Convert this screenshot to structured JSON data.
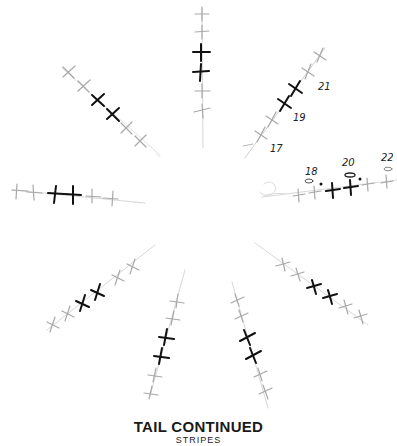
{
  "caption": {
    "title": "TAIL CONTINUED",
    "subtitle": "STRIPES"
  },
  "colors": {
    "light_cross": "#a8a8a8",
    "dark_cross": "#111111",
    "background": "#ffffff"
  },
  "row_labels": {
    "n17": "17",
    "n18": "18",
    "n19": "19",
    "n20": "20",
    "n21": "21",
    "n22": "22"
  },
  "spokes": [
    {
      "name": "top",
      "crosses": [
        "light",
        "light",
        "dark",
        "dark",
        "light",
        "light"
      ]
    },
    {
      "name": "upper-right",
      "crosses": [
        "light",
        "light",
        "dark",
        "dark",
        "light",
        "light"
      ]
    },
    {
      "name": "right",
      "crosses": [
        "light",
        "light",
        "dark",
        "dark",
        "light",
        "light"
      ]
    },
    {
      "name": "lower-right",
      "crosses": [
        "light",
        "light",
        "dark",
        "dark",
        "light",
        "light"
      ]
    },
    {
      "name": "bottom-right",
      "crosses": [
        "light",
        "light",
        "dark",
        "dark",
        "light",
        "light"
      ]
    },
    {
      "name": "bottom-left",
      "crosses": [
        "light",
        "light",
        "dark",
        "dark",
        "light",
        "light"
      ]
    },
    {
      "name": "lower-left",
      "crosses": [
        "light",
        "light",
        "dark",
        "dark",
        "light",
        "light"
      ]
    },
    {
      "name": "left",
      "crosses": [
        "light",
        "light",
        "dark",
        "dark",
        "light",
        "light"
      ]
    },
    {
      "name": "upper-left",
      "crosses": [
        "light",
        "light",
        "dark",
        "dark",
        "light",
        "light"
      ]
    }
  ]
}
